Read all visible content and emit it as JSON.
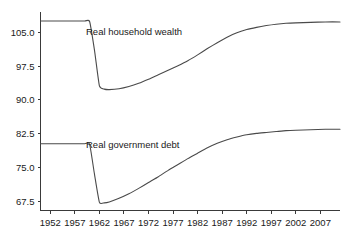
{
  "chart_data": {
    "type": "line",
    "title": "",
    "subtitle": "",
    "xlabel": "",
    "ylabel": "",
    "grid": false,
    "legend_position": "inline-annotation",
    "xlim": [
      1950,
      2011
    ],
    "ylim": [
      65.5,
      109.5
    ],
    "x_ticks": [
      1952,
      1957,
      1962,
      1967,
      1972,
      1977,
      1982,
      1987,
      1992,
      1997,
      2002,
      2007
    ],
    "x_tick_labels": [
      "1952",
      "1957",
      "1962",
      "1967",
      "1972",
      "1977",
      "1982",
      "1987",
      "1992",
      "1997",
      "2002",
      "2007"
    ],
    "y_ticks": [
      67.5,
      75.0,
      82.5,
      90.0,
      97.5,
      105.0
    ],
    "y_tick_labels": [
      "67.5",
      "75.0",
      "82.5",
      "90.0",
      "97.5",
      "105.0"
    ],
    "series": [
      {
        "name": "Real household wealth",
        "label": "Real household wealth",
        "color": "#4a4a4a",
        "x": [
          1950,
          1953,
          1956,
          1959,
          1960,
          1961,
          1962,
          1963,
          1964,
          1966,
          1968,
          1970,
          1972,
          1974,
          1976,
          1978,
          1980,
          1982,
          1984,
          1986,
          1988,
          1990,
          1992,
          1994,
          1996,
          1998,
          2000,
          2002,
          2005,
          2008,
          2011
        ],
        "y": [
          107.5,
          107.5,
          107.5,
          107.5,
          107.4,
          101.0,
          93.1,
          92.4,
          92.3,
          92.5,
          93.0,
          93.7,
          94.6,
          95.6,
          96.6,
          97.6,
          98.7,
          100.0,
          101.4,
          102.7,
          103.9,
          104.9,
          105.6,
          106.1,
          106.5,
          106.8,
          107.0,
          107.1,
          107.2,
          107.3,
          107.3
        ]
      },
      {
        "name": "Real government debt",
        "label": "Real government debt",
        "color": "#4a4a4a",
        "x": [
          1950,
          1953,
          1956,
          1959,
          1960,
          1961,
          1962,
          1963,
          1964,
          1966,
          1968,
          1970,
          1972,
          1974,
          1976,
          1978,
          1980,
          1982,
          1984,
          1986,
          1988,
          1990,
          1992,
          1994,
          1996,
          1998,
          2000,
          2002,
          2005,
          2008,
          2011
        ],
        "y": [
          80.3,
          80.3,
          80.3,
          80.3,
          80.2,
          73.5,
          67.3,
          67.2,
          67.4,
          68.2,
          69.2,
          70.4,
          71.7,
          73.0,
          74.4,
          75.7,
          77.0,
          78.2,
          79.4,
          80.4,
          81.2,
          81.8,
          82.3,
          82.6,
          82.8,
          83.0,
          83.2,
          83.3,
          83.4,
          83.5,
          83.5
        ]
      }
    ],
    "annotations": [
      {
        "name": "wealth-label",
        "text": "Real household wealth",
        "x_px": 86,
        "y_px": 35
      },
      {
        "name": "debt-label",
        "text": "Real government debt",
        "x_px": 86,
        "y_px": 148
      }
    ]
  }
}
